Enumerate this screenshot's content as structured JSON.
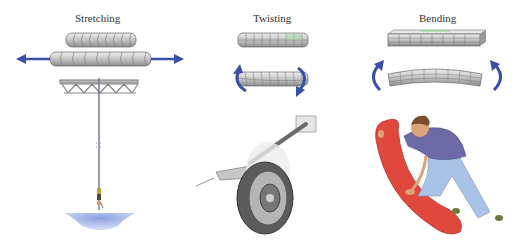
{
  "panels": [
    {
      "title": "Stretching",
      "example": "bungee jumper hanging from bridge truss"
    },
    {
      "title": "Twisting",
      "example": "car torsion bar suspension with wheel"
    },
    {
      "title": "Bending",
      "example": "person bending a red board"
    }
  ],
  "colors": {
    "arrow": "#3a4fa8",
    "cylinder": "#c8c8c8",
    "water": "#8fa6e0",
    "board": "#e0483e",
    "shirt": "#6e6aa8",
    "jeans": "#a9c3e6"
  }
}
